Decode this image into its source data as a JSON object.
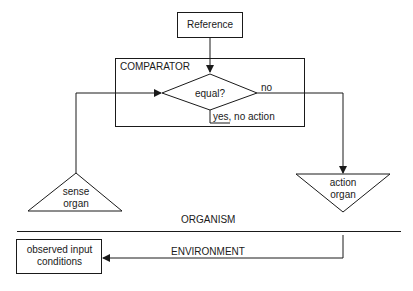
{
  "diagram": {
    "reference": {
      "label": "Reference"
    },
    "comparator": {
      "title": "COMPARATOR",
      "decision": "equal?",
      "no_label": "no",
      "yes_label": "yes, no action",
      "yes_underlined": "yes"
    },
    "sense_organ": {
      "line1": "sense",
      "line2": "organ"
    },
    "action_organ": {
      "line1": "action",
      "line2": "organ"
    },
    "organism_label": "ORGANISM",
    "environment_label": "ENVIRONMENT",
    "input_box": {
      "line1": "observed input",
      "line2": "conditions"
    },
    "colors": {
      "stroke": "#1a1a1a",
      "background": "#ffffff"
    }
  }
}
